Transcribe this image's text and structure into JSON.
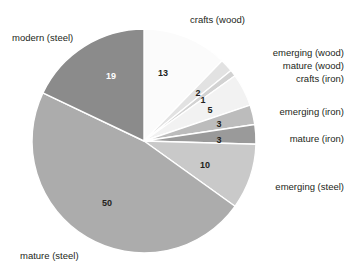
{
  "chart_data": {
    "type": "pie",
    "title": "",
    "subtitle": "",
    "xlabel": "",
    "ylabel": "",
    "legend_position": "outside-labels",
    "grid": false,
    "total": 106,
    "categories": [
      "crafts (wood)",
      "emerging (wood)",
      "mature (wood)",
      "crafts (iron)",
      "emerging (iron)",
      "mature (iron)",
      "emerging (steel)",
      "mature (steel)",
      "modern (steel)"
    ],
    "values": [
      13,
      2,
      1,
      5,
      3,
      3,
      10,
      50,
      19
    ],
    "colors": [
      "#fbfbfb",
      "#e2e2e2",
      "#d2d2d2",
      "#f2f2f2",
      "#bcbcbc",
      "#9a9a9a",
      "#c9c9c9",
      "#acacac",
      "#8b8b8b"
    ],
    "slices": [
      {
        "label": "crafts (wood)",
        "value": 13,
        "value_text": "13",
        "color": "#fbfbfb",
        "label_dark": false
      },
      {
        "label": "emerging (wood)",
        "value": 2,
        "value_text": "2",
        "color": "#e2e2e2",
        "label_dark": false
      },
      {
        "label": "mature (wood)",
        "value": 1,
        "value_text": "1",
        "color": "#d2d2d2",
        "label_dark": false
      },
      {
        "label": "crafts (iron)",
        "value": 5,
        "value_text": "5",
        "color": "#f2f2f2",
        "label_dark": false
      },
      {
        "label": "emerging (iron)",
        "value": 3,
        "value_text": "3",
        "color": "#bcbcbc",
        "label_dark": false
      },
      {
        "label": "mature (iron)",
        "value": 3,
        "value_text": "3",
        "color": "#9a9a9a",
        "label_dark": false
      },
      {
        "label": "emerging (steel)",
        "value": 10,
        "value_text": "10",
        "color": "#c9c9c9",
        "label_dark": false
      },
      {
        "label": "mature (steel)",
        "value": 50,
        "value_text": "50",
        "color": "#acacac",
        "label_dark": false
      },
      {
        "label": "modern (steel)",
        "value": 19,
        "value_text": "19",
        "color": "#8b8b8b",
        "label_dark": true
      }
    ]
  },
  "geometry": {
    "cx": 144,
    "cy": 141,
    "radius": 112,
    "start_angle_deg": -90,
    "direction": "clockwise",
    "separator_color": "#ffffff",
    "separator_width": 1.4
  },
  "value_labels": [
    {
      "name": "value-crafts-wood",
      "text": "13",
      "x": 163,
      "y": 76,
      "dark": false
    },
    {
      "name": "value-emerging-wood",
      "text": "2",
      "x": 198,
      "y": 96,
      "dark": false
    },
    {
      "name": "value-mature-wood",
      "text": "1",
      "x": 203,
      "y": 103,
      "dark": false
    },
    {
      "name": "value-crafts-iron",
      "text": "5",
      "x": 210,
      "y": 113,
      "dark": false
    },
    {
      "name": "value-emerging-iron",
      "text": "3",
      "x": 219,
      "y": 127,
      "dark": false
    },
    {
      "name": "value-mature-iron",
      "text": "3",
      "x": 219,
      "y": 143,
      "dark": false
    },
    {
      "name": "value-emerging-steel",
      "text": "10",
      "x": 205,
      "y": 168,
      "dark": false
    },
    {
      "name": "value-mature-steel",
      "text": "50",
      "x": 107,
      "y": 206,
      "dark": false
    },
    {
      "name": "value-modern-steel",
      "text": "19",
      "x": 111,
      "y": 79,
      "dark": true
    }
  ],
  "category_labels": [
    {
      "name": "label-modern-steel",
      "text": "modern (steel)",
      "left": 12,
      "top": 32,
      "align": "left"
    },
    {
      "name": "label-crafts-wood",
      "text": "crafts (wood)",
      "left": 190,
      "top": 14,
      "align": "left"
    },
    {
      "name": "label-emerging-wood",
      "text": "emerging (wood)",
      "right": 8,
      "top": 47,
      "align": "right"
    },
    {
      "name": "label-mature-wood",
      "text": "mature (wood)",
      "right": 8,
      "top": 60,
      "align": "right"
    },
    {
      "name": "label-crafts-iron",
      "text": "crafts (iron)",
      "right": 8,
      "top": 73,
      "align": "right"
    },
    {
      "name": "label-emerging-iron",
      "text": "emerging (iron)",
      "right": 8,
      "top": 106,
      "align": "right"
    },
    {
      "name": "label-mature-iron",
      "text": "mature (iron)",
      "right": 8,
      "top": 133,
      "align": "right"
    },
    {
      "name": "label-emerging-steel",
      "text": "emerging (steel)",
      "right": 8,
      "top": 181,
      "align": "right"
    },
    {
      "name": "label-mature-steel",
      "text": "mature (steel)",
      "left": 20,
      "top": 250,
      "align": "left"
    }
  ]
}
